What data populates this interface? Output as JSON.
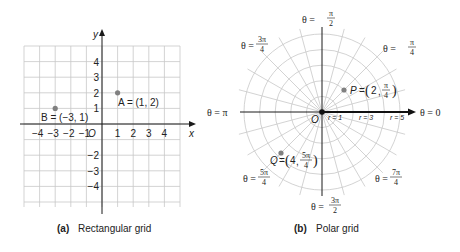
{
  "chart_data": [
    {
      "type": "scatter",
      "title": "Rectangular grid",
      "caption_letter": "(a)",
      "caption_text": "Rectangular grid",
      "xlabel": "x",
      "ylabel": "y",
      "xlim": [
        -5,
        5
      ],
      "ylim": [
        -5,
        5
      ],
      "grid": true,
      "x_ticks": [
        "-4",
        "-3",
        "-2",
        "-1",
        "1",
        "2",
        "3",
        "4"
      ],
      "y_ticks": [
        "4",
        "3",
        "2",
        "1",
        "-2",
        "-3",
        "-4"
      ],
      "origin_label": "O",
      "points": [
        {
          "name": "A",
          "x": 1,
          "y": 2,
          "label": "A = (1, 2)"
        },
        {
          "name": "B",
          "x": -3,
          "y": 1,
          "label": "B = (−3, 1)"
        }
      ]
    },
    {
      "type": "scatter",
      "title": "Polar grid",
      "caption_letter": "(b)",
      "caption_text": "Polar grid",
      "coordinate_system": "polar",
      "rings": [
        1,
        2,
        3,
        4,
        5
      ],
      "radial_step": "π/12",
      "ring_labels": [
        "r = 1",
        "r = 3",
        "r = 5"
      ],
      "origin_label": "O",
      "angle_labels": [
        {
          "theta": "0",
          "text": "θ = 0"
        },
        {
          "theta": "π/4",
          "text": "θ = π/4",
          "num": "π",
          "den": "4"
        },
        {
          "theta": "π/2",
          "text": "θ = π/2",
          "num": "π",
          "den": "2"
        },
        {
          "theta": "3π/4",
          "text": "θ = 3π/4",
          "num": "3π",
          "den": "4"
        },
        {
          "theta": "π",
          "text": "θ = π"
        },
        {
          "theta": "5π/4",
          "text": "θ = 5π/4",
          "num": "5π",
          "den": "4"
        },
        {
          "theta": "3π/2",
          "text": "θ = 3π/2",
          "num": "3π",
          "den": "2"
        },
        {
          "theta": "7π/4",
          "text": "θ = 7π/4",
          "num": "7π",
          "den": "4"
        }
      ],
      "points": [
        {
          "name": "P",
          "r": 2,
          "theta": "π/4",
          "label": "P = (2, π/4)",
          "num": "π",
          "den": "4",
          "r_text": "2"
        },
        {
          "name": "Q",
          "r": 4,
          "theta": "5π/4",
          "label": "Q = (4, 5π/4)",
          "num": "5π",
          "den": "4",
          "r_text": "4"
        }
      ]
    }
  ],
  "labels": {
    "theta_eq": "θ =",
    "p_name": "P",
    "q_name": "Q",
    "eq": "=",
    "a_label": "A = (1, 2)",
    "b_label": "B = (−3, 1)"
  }
}
